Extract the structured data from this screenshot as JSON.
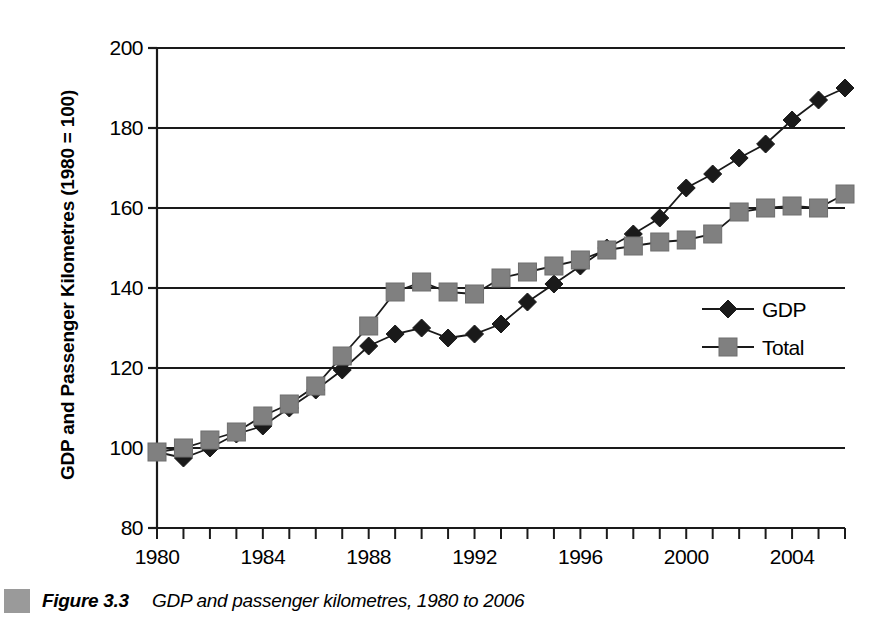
{
  "caption": {
    "figure_number": "Figure 3.3",
    "text": "GDP and passenger kilometres, 1980 to 2006",
    "swatch_color": "#9a9a9a"
  },
  "legend": {
    "position": "inside-right",
    "entries": [
      {
        "label": "GDP",
        "marker": "diamond",
        "color": "#1a1a1a"
      },
      {
        "label": "Total",
        "marker": "square",
        "color": "#808080"
      }
    ]
  },
  "chart_data": {
    "type": "line",
    "title": "",
    "subtitle": "",
    "xlabel": "",
    "ylabel": "GDP and Passenger Kilometres (1980 = 100)",
    "xlim": [
      1980,
      2006
    ],
    "ylim": [
      80,
      200
    ],
    "y_ticks": [
      80,
      100,
      120,
      140,
      160,
      180,
      200
    ],
    "y_tick_labels": [
      "80",
      "100",
      "120",
      "140",
      "160",
      "180",
      "200"
    ],
    "x_ticks": [
      1980,
      1981,
      1982,
      1983,
      1984,
      1985,
      1986,
      1987,
      1988,
      1989,
      1990,
      1991,
      1992,
      1993,
      1994,
      1995,
      1996,
      1997,
      1998,
      1999,
      2000,
      2001,
      2002,
      2003,
      2004,
      2005,
      2006
    ],
    "x_tick_labels": [
      "1980",
      "1984",
      "1988",
      "1992",
      "1996",
      "2000",
      "2004"
    ],
    "x_labelled_ticks": [
      1980,
      1984,
      1988,
      1992,
      1996,
      2000,
      2004
    ],
    "grid": "horizontal",
    "x": [
      1980,
      1981,
      1982,
      1983,
      1984,
      1985,
      1986,
      1987,
      1988,
      1989,
      1990,
      1991,
      1992,
      1993,
      1994,
      1995,
      1996,
      1997,
      1998,
      1999,
      2000,
      2001,
      2002,
      2003,
      2004,
      2005,
      2006
    ],
    "series": [
      {
        "name": "GDP",
        "marker": "diamond",
        "color": "#1a1a1a",
        "values": [
          99,
          97.5,
          100,
          103.5,
          105.5,
          110,
          114.5,
          119.5,
          125.5,
          128.5,
          130,
          127.5,
          128.5,
          131,
          136.5,
          141,
          145.5,
          150,
          153.5,
          157.5,
          165,
          168.5,
          172.5,
          176,
          182,
          187,
          190
        ]
      },
      {
        "name": "Total",
        "marker": "square",
        "color": "#808080",
        "values": [
          99,
          100,
          102,
          104,
          108,
          111,
          115.5,
          123,
          130.5,
          139,
          141.5,
          139,
          138.5,
          142.5,
          144,
          145.5,
          147,
          149.5,
          150.5,
          151.5,
          152,
          153.5,
          159,
          160,
          160.5,
          160,
          163.5
        ]
      }
    ]
  }
}
